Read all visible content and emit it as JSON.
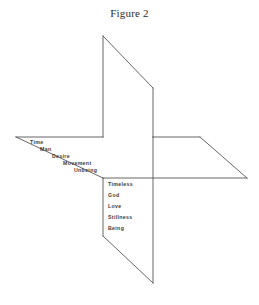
{
  "figure": {
    "title": "Figure 2",
    "stroke_color": "#555555",
    "text_color": "#3a3a3a",
    "background_color": "#ffffff"
  },
  "labels": {
    "descending_group": {
      "name": "time-axis-labels",
      "items": [
        {
          "text": "Time",
          "x": 30,
          "y": 139
        },
        {
          "text": "Man",
          "x": 40,
          "y": 146
        },
        {
          "text": "Desire",
          "x": 52,
          "y": 153
        },
        {
          "text": "Movement",
          "x": 63,
          "y": 160
        },
        {
          "text": "Unbeing",
          "x": 74,
          "y": 167
        }
      ]
    },
    "vertical_group": {
      "name": "timeless-axis-labels",
      "items": [
        {
          "text": "Timeless",
          "x": 108,
          "y": 181
        },
        {
          "text": "God",
          "x": 108,
          "y": 192
        },
        {
          "text": "Love",
          "x": 108,
          "y": 203
        },
        {
          "text": "Stillness",
          "x": 108,
          "y": 214
        },
        {
          "text": "Being",
          "x": 108,
          "y": 225
        }
      ]
    }
  },
  "geometry": {
    "description": "pinwheel of four rotating planes",
    "top_wing_points": "103,36 103,137 153,137 153,88 103,36",
    "right_wing_points": "153,137 247,137 247,178 153,178 153,137",
    "bottom_wing_points": "153,178 153,283 103,283 103,178 153,178",
    "left_wing_points": "103,137 16,137 16,178 103,178 103,137",
    "strokes": [
      {
        "name": "top-wing-left-edge",
        "d": "M103,36 L103,137"
      },
      {
        "name": "top-wing-diagonal",
        "d": "M103,36 L153,88"
      },
      {
        "name": "top-wing-right-edge",
        "d": "M153,88 L153,137"
      },
      {
        "name": "upper-horizontal",
        "d": "M103,137 L16,137"
      },
      {
        "name": "left-wing-diagonal",
        "d": "M16,137 L103,178"
      },
      {
        "name": "lower-horizontal",
        "d": "M103,178 L247,178"
      },
      {
        "name": "right-upper-horizontal",
        "d": "M153,137 L200,137"
      },
      {
        "name": "right-wing-diagonal",
        "d": "M200,137 L247,178"
      },
      {
        "name": "center-right-vertical",
        "d": "M153,137 L153,283"
      },
      {
        "name": "bottom-wing-left-edge",
        "d": "M103,178 L103,236"
      },
      {
        "name": "bottom-wing-diagonal",
        "d": "M103,236 L153,283"
      }
    ]
  }
}
